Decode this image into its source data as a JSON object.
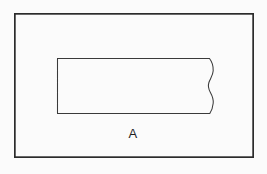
{
  "figure": {
    "canvas": {
      "width": 267,
      "height": 174,
      "background_color": "#fbfbfb"
    },
    "outer_frame": {
      "name": "drawing border",
      "x": 14,
      "y": 13,
      "width": 240,
      "height": 145,
      "stroke_color": "#2b2b2b",
      "stroke_width": 1.7,
      "fill": "none"
    },
    "inner_part": {
      "name": "rectangular part with broken right end",
      "x": 57,
      "y": 58,
      "width": 153,
      "height": 56,
      "stroke_color": "#3a3a3a",
      "stroke_width": 1.05,
      "fill": "#fbfbfb",
      "right_edge_style": "wavy break line",
      "path": "M 57.5 58.5 L 209.5 58.5 C 212.6 62.5 213.4 66.5 213.2 70.8 C 213.0 75.4 210.2 78.8 208.9 82.5 C 207.8 85.8 208.6 89.2 210.4 92.4 C 212.3 95.8 213.6 99.2 213.2 103.2 C 212.8 107.4 211.4 111.1 209.8 113.5 L 57.5 113.5 Z"
    },
    "labels": [
      {
        "text": "A",
        "x": 133,
        "y": 138,
        "font_size": 13,
        "color": "#1f1f1f",
        "anchor": "middle"
      }
    ]
  }
}
